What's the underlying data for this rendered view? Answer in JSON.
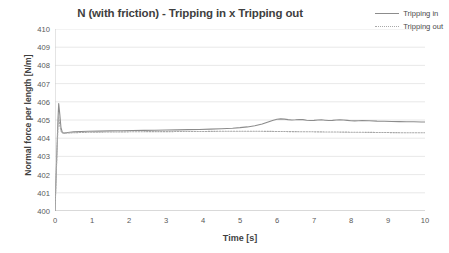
{
  "chart_data": {
    "type": "line",
    "title": "N (with friction) - Tripping in x Tripping out",
    "xlabel": "Time [s]",
    "ylabel": "Normal force per length [N/m]",
    "xlim": [
      0,
      10
    ],
    "ylim": [
      400,
      410
    ],
    "xticks": [
      0,
      1,
      2,
      3,
      4,
      5,
      6,
      7,
      8,
      9,
      10
    ],
    "yticks": [
      400,
      401,
      402,
      403,
      404,
      405,
      406,
      407,
      408,
      409,
      410
    ],
    "grid": "horizontal",
    "legend_position": "top-right",
    "series": [
      {
        "name": "Tripping in",
        "style": "solid",
        "color": "#8c8c8c",
        "x": [
          0,
          0.05,
          0.08,
          0.1,
          0.13,
          0.16,
          0.2,
          0.25,
          0.3,
          0.4,
          0.5,
          0.7,
          0.9,
          1.2,
          1.5,
          1.8,
          2.1,
          2.4,
          2.7,
          3.0,
          3.3,
          3.6,
          3.9,
          4.2,
          4.5,
          4.8,
          5.0,
          5.2,
          5.4,
          5.6,
          5.7,
          5.8,
          5.9,
          6.0,
          6.1,
          6.2,
          6.3,
          6.4,
          6.5,
          6.6,
          6.7,
          6.8,
          6.9,
          7.0,
          7.1,
          7.2,
          7.3,
          7.4,
          7.5,
          7.6,
          7.7,
          7.8,
          7.9,
          8.0,
          8.1,
          8.2,
          8.3,
          8.5,
          8.7,
          8.9,
          9.1,
          9.3,
          9.5,
          9.7,
          9.9,
          10
        ],
        "y": [
          400.0,
          403.2,
          405.0,
          405.9,
          405.3,
          404.6,
          404.3,
          404.28,
          404.3,
          404.33,
          404.35,
          404.37,
          404.38,
          404.39,
          404.4,
          404.41,
          404.42,
          404.43,
          404.44,
          404.45,
          404.46,
          404.47,
          404.48,
          404.5,
          404.52,
          404.55,
          404.58,
          404.62,
          404.68,
          404.78,
          404.85,
          404.92,
          404.99,
          405.04,
          405.06,
          405.05,
          405.02,
          405.0,
          405.01,
          405.03,
          405.02,
          404.99,
          404.97,
          404.98,
          405.0,
          405.01,
          404.99,
          404.97,
          404.98,
          405.0,
          405.01,
          405.0,
          404.98,
          404.96,
          404.95,
          404.96,
          404.97,
          404.96,
          404.94,
          404.93,
          404.92,
          404.91,
          404.9,
          404.9,
          404.89,
          404.89
        ]
      },
      {
        "name": "Tripping out",
        "style": "dotted",
        "color": "#a8a8a8",
        "x": [
          0,
          0.05,
          0.08,
          0.1,
          0.13,
          0.16,
          0.2,
          0.3,
          0.5,
          1.0,
          1.5,
          2.0,
          2.5,
          3.0,
          3.5,
          4.0,
          4.5,
          5.0,
          5.5,
          6.0,
          6.5,
          7.0,
          7.5,
          8.0,
          8.5,
          9.0,
          9.5,
          10
        ],
        "y": [
          400.0,
          403.0,
          404.6,
          405.2,
          404.7,
          404.4,
          404.3,
          404.28,
          404.3,
          404.33,
          404.34,
          404.35,
          404.36,
          404.36,
          404.37,
          404.37,
          404.38,
          404.38,
          404.38,
          404.37,
          404.36,
          404.35,
          404.34,
          404.33,
          404.32,
          404.31,
          404.3,
          404.3
        ]
      }
    ]
  },
  "legend": {
    "items": [
      {
        "label": "Tripping in"
      },
      {
        "label": "Tripping out"
      }
    ]
  }
}
